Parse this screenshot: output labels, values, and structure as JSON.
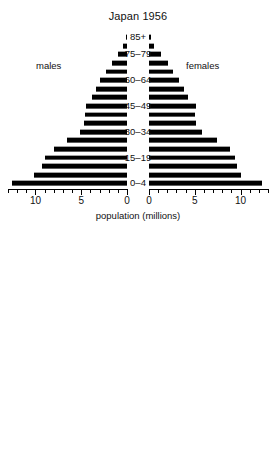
{
  "figure": {
    "xaxis_title": "population (millions)",
    "bar_color": "#000000"
  },
  "labels": {
    "males": "males",
    "females": "females"
  },
  "age_groups": [
    "0–4",
    "5–9",
    "10–14",
    "15–19",
    "20–24",
    "25–29",
    "30–34",
    "35–39",
    "40–44",
    "45–49",
    "50–54",
    "55–59",
    "60–64",
    "65–69",
    "70–74",
    "75–79",
    "80–84",
    "85+"
  ],
  "age_labels_shown": [
    "0–4",
    "15–19",
    "30–34",
    "45–49",
    "60–64",
    "75–79",
    "85+"
  ],
  "charts": [
    {
      "id": "japan",
      "title": "Japan 1956",
      "tick_labels_left": [
        "10",
        "5",
        "0"
      ],
      "tick_labels_right": [
        "0",
        "5",
        "10"
      ],
      "axis_max": 13,
      "tick_step": 1,
      "major_tick_step": 5
    },
    {
      "id": "france",
      "title": "France 1956",
      "tick_labels_left": [
        "10",
        "5",
        "0"
      ],
      "tick_labels_right": [
        "0",
        "5",
        "10"
      ],
      "axis_max": 10,
      "tick_step": 1,
      "major_tick_step": 5
    }
  ],
  "chart_data": [
    {
      "type": "bar",
      "subtype": "population-pyramid",
      "title": "Japan 1956",
      "xlabel": "population (millions)",
      "ylabel": "",
      "categories": [
        "0–4",
        "5–9",
        "10–14",
        "15–19",
        "20–24",
        "25–29",
        "30–34",
        "35–39",
        "40–44",
        "45–49",
        "50–54",
        "55–59",
        "60–64",
        "65–69",
        "70–74",
        "75–79",
        "80–84",
        "85+"
      ],
      "series": [
        {
          "name": "males",
          "values": [
            12.6,
            10.2,
            9.3,
            9.0,
            8.0,
            6.6,
            5.1,
            4.7,
            4.6,
            4.5,
            3.8,
            3.4,
            2.9,
            2.3,
            1.6,
            1.0,
            0.45,
            0.15
          ]
        },
        {
          "name": "females",
          "values": [
            12.3,
            10.0,
            9.6,
            9.4,
            8.8,
            7.4,
            5.8,
            5.1,
            5.0,
            5.1,
            4.3,
            3.8,
            3.3,
            2.6,
            2.1,
            1.3,
            0.6,
            0.25
          ]
        }
      ],
      "xlim": [
        0,
        13
      ],
      "grid": false,
      "legend": "inside-left-and-right",
      "tick_values": [
        10,
        5,
        0,
        0,
        5,
        10
      ]
    },
    {
      "type": "bar",
      "subtype": "population-pyramid",
      "title": "France 1956",
      "xlabel": "",
      "ylabel": "",
      "categories": [
        "0–4",
        "5–9",
        "10–14",
        "15–19",
        "20–24",
        "25–29",
        "30–34",
        "35–39",
        "40–44",
        "45–49",
        "50–54",
        "55–59",
        "60–64",
        "65–69",
        "70–74",
        "75–79",
        "80–84",
        "85+"
      ],
      "series": [
        {
          "name": "males",
          "values": [
            8.7,
            6.8,
            5.9,
            6.7,
            7.1,
            7.2,
            6.8,
            4.6,
            4.8,
            6.8,
            6.9,
            6.4,
            4.0,
            3.4,
            2.8,
            2.1,
            1.1,
            0.25
          ]
        },
        {
          "name": "females",
          "values": [
            8.4,
            7.8,
            6.0,
            6.9,
            7.2,
            7.4,
            5.6,
            5.5,
            6.5,
            6.8,
            6.9,
            6.1,
            5.6,
            4.9,
            3.9,
            2.9,
            1.8,
            0.8
          ]
        }
      ],
      "xlim": [
        0,
        10
      ],
      "grid": false,
      "legend": "inside-left-and-right",
      "tick_values": [
        10,
        5,
        0,
        0,
        5,
        10
      ]
    }
  ]
}
